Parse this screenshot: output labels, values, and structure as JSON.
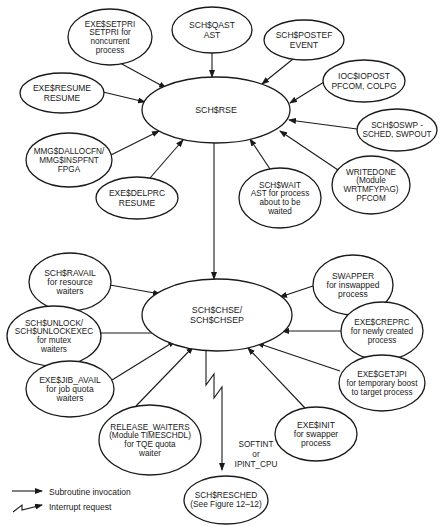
{
  "diagram": {
    "nodes": [
      {
        "id": "exe_setpri",
        "lines": [
          "EXE$SETPRI",
          "SETPRI for",
          "noncurrent",
          "process"
        ],
        "cx": 110,
        "cy": 37,
        "rx": 42,
        "ry": 28,
        "fs": 8.2
      },
      {
        "id": "sch_qast",
        "lines": [
          "SCH$QAST",
          "AST"
        ],
        "cx": 212,
        "cy": 30,
        "rx": 40,
        "ry": 23,
        "fs": 8.5
      },
      {
        "id": "sch_postef",
        "lines": [
          "SCH$POSTEF",
          "EVENT"
        ],
        "cx": 304,
        "cy": 40,
        "rx": 40,
        "ry": 20,
        "fs": 8.5
      },
      {
        "id": "ioc_iopost",
        "lines": [
          "IOC$IOPOST",
          "PFCOM, COLPG"
        ],
        "cx": 364,
        "cy": 81,
        "rx": 41,
        "ry": 21,
        "fs": 8.5
      },
      {
        "id": "exe_resume",
        "lines": [
          "EXE$RESUME",
          "RESUME"
        ],
        "cx": 62,
        "cy": 93,
        "rx": 42,
        "ry": 20,
        "fs": 8.5
      },
      {
        "id": "sch_rse",
        "lines": [
          "SCH$RSE"
        ],
        "cx": 216,
        "cy": 110,
        "rx": 74,
        "ry": 33,
        "fs": 8.8
      },
      {
        "id": "sch_oswp",
        "lines": [
          "SCH$OSWP -",
          "SCHED, SWPOUT"
        ],
        "cx": 397,
        "cy": 130,
        "rx": 40,
        "ry": 21,
        "fs": 8.2
      },
      {
        "id": "mmg_dallocfn",
        "lines": [
          "MMG$DALLOCFN/",
          "MMG$INSPFNT",
          "FPGA"
        ],
        "cx": 69,
        "cy": 160,
        "rx": 43,
        "ry": 27,
        "fs": 8.2
      },
      {
        "id": "exe_delprc",
        "lines": [
          "EXE$DELPRC",
          "RESUME"
        ],
        "cx": 137,
        "cy": 198,
        "rx": 41,
        "ry": 21,
        "fs": 8.5
      },
      {
        "id": "sch_wait",
        "lines": [
          "SCH$WAIT",
          "AST for process",
          "about to be",
          "waited"
        ],
        "cx": 280,
        "cy": 198,
        "rx": 41,
        "ry": 30,
        "fs": 8.2
      },
      {
        "id": "writedone",
        "lines": [
          "WRITEDONE",
          "(Module",
          "WRTMFYPAG)",
          "PFCOM"
        ],
        "cx": 371,
        "cy": 185,
        "rx": 39,
        "ry": 29,
        "fs": 8.2
      },
      {
        "id": "sch_ravail",
        "lines": [
          "SCH$RAVAIL",
          "for resource",
          "waiters"
        ],
        "cx": 70,
        "cy": 282,
        "rx": 41,
        "ry": 29,
        "fs": 8.5
      },
      {
        "id": "swapper",
        "lines": [
          "SWAPPER",
          "for inswapped",
          "process"
        ],
        "cx": 353,
        "cy": 285,
        "rx": 40,
        "ry": 30,
        "fs": 8.5
      },
      {
        "id": "sch_chse",
        "lines": [
          "SCH$CHSE/",
          "SCH$CHSEP"
        ],
        "cx": 217,
        "cy": 315,
        "rx": 75,
        "ry": 36,
        "fs": 8.8
      },
      {
        "id": "sch_unlock",
        "lines": [
          "SCH$UNLOCK/",
          "SCH$UNLOCKEXEC",
          "for mutex",
          "waiters"
        ],
        "cx": 54,
        "cy": 336,
        "rx": 47,
        "ry": 30,
        "fs": 8.2
      },
      {
        "id": "exe_creprc",
        "lines": [
          "EXE$CREPRC",
          "for newly created",
          "process"
        ],
        "cx": 382,
        "cy": 331,
        "rx": 41,
        "ry": 29,
        "fs": 8.2
      },
      {
        "id": "exe_jib_avail",
        "lines": [
          "EXE$JIB_AVAIL",
          "for job quota",
          "waiters"
        ],
        "cx": 70,
        "cy": 389,
        "rx": 44,
        "ry": 28,
        "fs": 8.5
      },
      {
        "id": "exe_getjpi",
        "lines": [
          "EXE$GETJPI",
          "for temporary boost",
          "to target process"
        ],
        "cx": 382,
        "cy": 383,
        "rx": 43,
        "ry": 28,
        "fs": 8.2
      },
      {
        "id": "release_waiters",
        "lines": [
          "RELEASE_WAITERS",
          "(Module TIMESCHDL)",
          "for TQE quota",
          "waiter"
        ],
        "cx": 150,
        "cy": 440,
        "rx": 51,
        "ry": 35,
        "fs": 8.2
      },
      {
        "id": "exe_init",
        "lines": [
          "EXE$INIT",
          "for swapper",
          "process"
        ],
        "cx": 316,
        "cy": 434,
        "rx": 41,
        "ry": 27,
        "fs": 8.5
      },
      {
        "id": "sch_resched",
        "lines": [
          "SCH$RESCHED",
          "(See Figure 12–12)"
        ],
        "cx": 226,
        "cy": 500,
        "rx": 42,
        "ry": 24,
        "fs": 8.3
      }
    ],
    "edges": [
      {
        "from": "exe_setpri",
        "to": "sch_rse",
        "x1": 120,
        "y1": 63,
        "x2": 166,
        "y2": 88
      },
      {
        "from": "sch_qast",
        "to": "sch_rse",
        "x1": 212,
        "y1": 53,
        "x2": 212,
        "y2": 77
      },
      {
        "from": "sch_postef",
        "to": "sch_rse",
        "x1": 293,
        "y1": 59,
        "x2": 262,
        "y2": 84
      },
      {
        "from": "ioc_iopost",
        "to": "sch_rse",
        "x1": 324,
        "y1": 82,
        "x2": 290,
        "y2": 103
      },
      {
        "from": "exe_resume",
        "to": "sch_rse",
        "x1": 103,
        "y1": 92,
        "x2": 145,
        "y2": 102
      },
      {
        "from": "sch_oswp",
        "to": "sch_rse",
        "x1": 357,
        "y1": 129,
        "x2": 289,
        "y2": 120
      },
      {
        "from": "mmg_dallocfn",
        "to": "sch_rse",
        "x1": 111,
        "y1": 155,
        "x2": 159,
        "y2": 131
      },
      {
        "from": "exe_delprc",
        "to": "sch_rse",
        "x1": 150,
        "y1": 178,
        "x2": 183,
        "y2": 140
      },
      {
        "from": "sch_wait",
        "to": "sch_rse",
        "x1": 270,
        "y1": 169,
        "x2": 250,
        "y2": 139
      },
      {
        "from": "writedone",
        "to": "sch_rse",
        "x1": 338,
        "y1": 170,
        "x2": 280,
        "y2": 131
      },
      {
        "from": "sch_rse",
        "to": "sch_chse",
        "x1": 214,
        "y1": 143,
        "x2": 214,
        "y2": 279
      },
      {
        "from": "sch_ravail",
        "to": "sch_chse",
        "x1": 110,
        "y1": 285,
        "x2": 160,
        "y2": 294
      },
      {
        "from": "swapper",
        "to": "sch_chse",
        "x1": 313,
        "y1": 286,
        "x2": 280,
        "y2": 297
      },
      {
        "from": "sch_unlock",
        "to": "sch_chse",
        "x1": 100,
        "y1": 333,
        "x2": 168,
        "y2": 333
      },
      {
        "from": "exe_creprc",
        "to": "sch_chse",
        "x1": 341,
        "y1": 331,
        "x2": 282,
        "y2": 331
      },
      {
        "from": "exe_jib_avail",
        "to": "sch_chse",
        "x1": 112,
        "y1": 380,
        "x2": 175,
        "y2": 341
      },
      {
        "from": "exe_getjpi",
        "to": "sch_chse",
        "x1": 340,
        "y1": 371,
        "x2": 257,
        "y2": 343
      },
      {
        "from": "release_waiters",
        "to": "sch_chse",
        "x1": 136,
        "y1": 406,
        "x2": 193,
        "y2": 347
      },
      {
        "from": "exe_init",
        "to": "sch_chse",
        "x1": 305,
        "y1": 408,
        "x2": 248,
        "y2": 348
      }
    ],
    "interrupt_edge": {
      "from": "sch_chse",
      "to": "sch_resched",
      "points": "206,351 206,385 214,374 214,398 222,387 222,470",
      "label_lines": [
        "SOFTINT",
        "or",
        "IPINT_CPU"
      ],
      "label_x": 256,
      "label_y": 447
    },
    "legend": {
      "items": [
        {
          "kind": "subroutine",
          "label": "Subroutine invocation"
        },
        {
          "kind": "interrupt",
          "label": "Interrupt request"
        }
      ]
    }
  }
}
